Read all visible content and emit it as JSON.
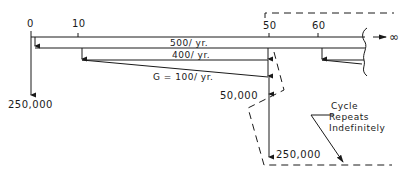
{
  "diagram": {
    "type": "cash-flow-diagram",
    "axis": {
      "ticks": [
        {
          "label": "0",
          "year": 0
        },
        {
          "label": "10",
          "year": 10
        },
        {
          "label": "50",
          "year": 50
        },
        {
          "label": "60",
          "year": 60
        }
      ],
      "infinity_label": "∞"
    },
    "flows": {
      "annual_500": "500/ yr.",
      "annual_400": "400/ yr.",
      "gradient": "G = 100/ yr.",
      "initial_cost": "250,000",
      "cost_50_small": "50,000",
      "cost_50_large": "250,000"
    },
    "annotation": {
      "line1": "Cycle",
      "line2": "Repeats",
      "line3": "Indefinitely"
    },
    "colors": {
      "ink": "#1a1a1a",
      "background": "#ffffff"
    }
  }
}
